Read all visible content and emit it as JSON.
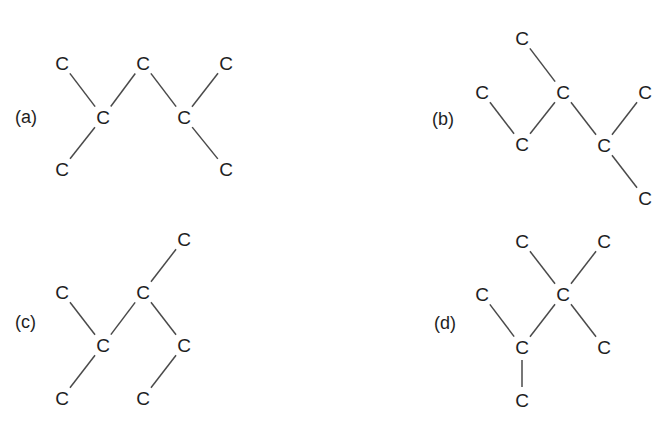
{
  "colors": {
    "text": "#1e1e1e",
    "bond": "#4a4a4a",
    "background": "#ffffff"
  },
  "structures": [
    {
      "label": "(a)",
      "label_pos": [
        15,
        117
      ],
      "atoms": [
        {
          "symbol": "C",
          "x": 62,
          "y": 63
        },
        {
          "symbol": "C",
          "x": 143,
          "y": 63
        },
        {
          "symbol": "C",
          "x": 226,
          "y": 63
        },
        {
          "symbol": "C",
          "x": 103,
          "y": 117
        },
        {
          "symbol": "C",
          "x": 184,
          "y": 117
        },
        {
          "symbol": "C",
          "x": 62,
          "y": 169
        },
        {
          "symbol": "C",
          "x": 226,
          "y": 169
        }
      ],
      "bonds": [
        [
          0,
          3
        ],
        [
          3,
          1
        ],
        [
          1,
          4
        ],
        [
          4,
          2
        ],
        [
          3,
          5
        ],
        [
          4,
          6
        ]
      ]
    },
    {
      "label": "(b)",
      "label_pos": [
        432,
        119
      ],
      "atoms": [
        {
          "symbol": "C",
          "x": 522,
          "y": 38
        },
        {
          "symbol": "C",
          "x": 482,
          "y": 92
        },
        {
          "symbol": "C",
          "x": 563,
          "y": 92
        },
        {
          "symbol": "C",
          "x": 645,
          "y": 92
        },
        {
          "symbol": "C",
          "x": 522,
          "y": 144
        },
        {
          "symbol": "C",
          "x": 604,
          "y": 145
        },
        {
          "symbol": "C",
          "x": 645,
          "y": 198
        }
      ],
      "bonds": [
        [
          0,
          2
        ],
        [
          1,
          4
        ],
        [
          4,
          2
        ],
        [
          2,
          5
        ],
        [
          5,
          3
        ],
        [
          5,
          6
        ]
      ]
    },
    {
      "label": "(c)",
      "label_pos": [
        15,
        322
      ],
      "atoms": [
        {
          "symbol": "C",
          "x": 184,
          "y": 239
        },
        {
          "symbol": "C",
          "x": 62,
          "y": 292
        },
        {
          "symbol": "C",
          "x": 143,
          "y": 292
        },
        {
          "symbol": "C",
          "x": 103,
          "y": 345
        },
        {
          "symbol": "C",
          "x": 184,
          "y": 345
        },
        {
          "symbol": "C",
          "x": 62,
          "y": 398
        },
        {
          "symbol": "C",
          "x": 143,
          "y": 398
        }
      ],
      "bonds": [
        [
          0,
          2
        ],
        [
          1,
          3
        ],
        [
          3,
          2
        ],
        [
          2,
          4
        ],
        [
          3,
          5
        ],
        [
          4,
          6
        ]
      ]
    },
    {
      "label": "(d)",
      "label_pos": [
        434,
        323
      ],
      "atoms": [
        {
          "symbol": "C",
          "x": 522,
          "y": 241
        },
        {
          "symbol": "C",
          "x": 604,
          "y": 241
        },
        {
          "symbol": "C",
          "x": 482,
          "y": 294
        },
        {
          "symbol": "C",
          "x": 563,
          "y": 294
        },
        {
          "symbol": "C",
          "x": 522,
          "y": 347
        },
        {
          "symbol": "C",
          "x": 604,
          "y": 347
        },
        {
          "symbol": "C",
          "x": 522,
          "y": 400
        }
      ],
      "bonds": [
        [
          0,
          3
        ],
        [
          1,
          3
        ],
        [
          2,
          4
        ],
        [
          4,
          3
        ],
        [
          3,
          5
        ],
        [
          4,
          6
        ]
      ]
    }
  ]
}
